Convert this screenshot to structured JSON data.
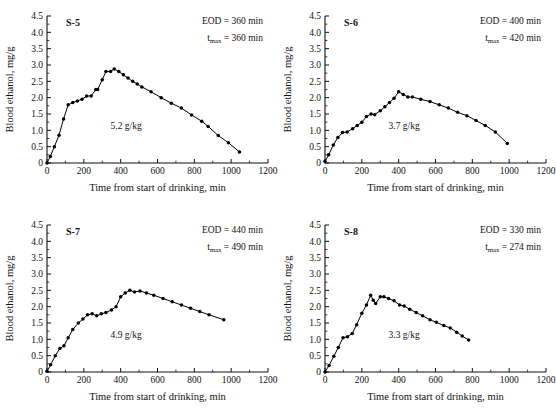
{
  "figure": {
    "panel_count": 4,
    "axis": {
      "xlabel": "Time from start of drinking, min",
      "ylabel": "Blood ethanol, mg/g",
      "xlim": [
        0,
        1200
      ],
      "ylim": [
        0,
        4.5
      ],
      "xticks": [
        0,
        200,
        400,
        600,
        800,
        1000,
        1200
      ],
      "xticklabels": [
        "0",
        "200",
        "400",
        "600",
        "800",
        "1000",
        "1200"
      ],
      "yticks": [
        0,
        0.5,
        1.0,
        1.5,
        2.0,
        2.5,
        3.0,
        3.5,
        4.0,
        4.5
      ],
      "yticklabels": [
        "0",
        "0.5",
        "1.0",
        "1.5",
        "2.0",
        "2.5",
        "3.0",
        "3.5",
        "4.0",
        "4.5"
      ],
      "grid": false,
      "legend": "none"
    }
  },
  "chart_data": [
    {
      "type": "line",
      "id": "S-5",
      "title": "S-5",
      "xlabel": "Time from start of drinking, min",
      "ylabel": "Blood ethanol, mg/g",
      "xlim": [
        0,
        1200
      ],
      "ylim": [
        0,
        4.5
      ],
      "annotations": {
        "eod_label": "EOD = 360 min",
        "tmax_prefix": "t",
        "tmax_sub": "max",
        "tmax_label": " = 360 min",
        "dose": "5.2 g/kg"
      },
      "eod_min": 360,
      "tmax_min": 360,
      "dose_g_per_kg": 5.2,
      "x": [
        0,
        18,
        40,
        65,
        90,
        115,
        140,
        165,
        190,
        215,
        240,
        265,
        275,
        300,
        320,
        345,
        365,
        390,
        415,
        440,
        465,
        490,
        515,
        565,
        620,
        675,
        730,
        785,
        840,
        875,
        930,
        985,
        1045
      ],
      "y": [
        0.0,
        0.2,
        0.5,
        0.85,
        1.35,
        1.78,
        1.85,
        1.9,
        1.95,
        2.05,
        2.05,
        2.25,
        2.25,
        2.55,
        2.8,
        2.8,
        2.88,
        2.8,
        2.7,
        2.6,
        2.5,
        2.42,
        2.33,
        2.18,
        2.0,
        1.83,
        1.68,
        1.47,
        1.28,
        1.12,
        0.84,
        0.62,
        0.34
      ]
    },
    {
      "type": "line",
      "id": "S-6",
      "title": "S-6",
      "xlabel": "Time from start of drinking, min",
      "ylabel": "Blood ethanol, mg/g",
      "xlim": [
        0,
        1200
      ],
      "ylim": [
        0,
        4.5
      ],
      "annotations": {
        "eod_label": "EOD = 400 min",
        "tmax_prefix": "t",
        "tmax_sub": "max",
        "tmax_label": " = 420 min",
        "dose": "3.7 g/kg"
      },
      "eod_min": 400,
      "tmax_min": 420,
      "dose_g_per_kg": 3.7,
      "x": [
        0,
        20,
        45,
        70,
        95,
        120,
        150,
        175,
        200,
        225,
        250,
        270,
        300,
        325,
        350,
        375,
        400,
        425,
        450,
        475,
        520,
        570,
        620,
        670,
        720,
        770,
        820,
        870,
        925,
        990
      ],
      "y": [
        0.05,
        0.25,
        0.55,
        0.78,
        0.93,
        0.95,
        1.05,
        1.15,
        1.25,
        1.42,
        1.5,
        1.48,
        1.6,
        1.72,
        1.85,
        1.98,
        2.18,
        2.1,
        2.02,
        2.02,
        1.95,
        1.88,
        1.78,
        1.68,
        1.55,
        1.45,
        1.3,
        1.15,
        0.95,
        0.6
      ]
    },
    {
      "type": "line",
      "id": "S-7",
      "title": "S-7",
      "xlabel": "Time from start of drinking, min",
      "ylabel": "Blood ethanol, mg/g",
      "xlim": [
        0,
        1200
      ],
      "ylim": [
        0,
        4.5
      ],
      "annotations": {
        "eod_label": "EOD = 440 min",
        "tmax_prefix": "t",
        "tmax_sub": "max",
        "tmax_label": " = 490 min",
        "dose": "4.9 g/kg"
      },
      "eod_min": 440,
      "tmax_min": 490,
      "dose_g_per_kg": 4.9,
      "x": [
        0,
        20,
        45,
        70,
        92,
        115,
        140,
        170,
        195,
        220,
        245,
        270,
        295,
        320,
        350,
        375,
        400,
        425,
        450,
        475,
        505,
        540,
        580,
        630,
        680,
        730,
        780,
        830,
        880,
        960
      ],
      "y": [
        0.02,
        0.22,
        0.5,
        0.72,
        0.8,
        1.05,
        1.3,
        1.5,
        1.62,
        1.75,
        1.78,
        1.72,
        1.78,
        1.82,
        1.9,
        2.0,
        2.3,
        2.42,
        2.5,
        2.45,
        2.48,
        2.42,
        2.35,
        2.25,
        2.15,
        2.05,
        1.95,
        1.85,
        1.75,
        1.6
      ]
    },
    {
      "type": "line",
      "id": "S-8",
      "title": "S-8",
      "xlabel": "Time from start of drinking, min",
      "ylabel": "Blood ethanol, mg/g",
      "xlim": [
        0,
        1200
      ],
      "ylim": [
        0,
        4.5
      ],
      "annotations": {
        "eod_label": "EOD = 330 min",
        "tmax_prefix": "t",
        "tmax_sub": "max",
        "tmax_label": " = 274 min",
        "dose": "3.3 g/kg"
      },
      "eod_min": 330,
      "tmax_min": 274,
      "dose_g_per_kg": 3.3,
      "x": [
        0,
        22,
        48,
        72,
        98,
        122,
        148,
        172,
        200,
        225,
        248,
        262,
        275,
        300,
        320,
        345,
        375,
        405,
        430,
        460,
        495,
        530,
        570,
        605,
        645,
        680,
        715,
        745,
        780
      ],
      "y": [
        0.0,
        0.2,
        0.48,
        0.75,
        1.05,
        1.08,
        1.18,
        1.45,
        1.8,
        2.05,
        2.35,
        2.2,
        2.1,
        2.3,
        2.3,
        2.25,
        2.18,
        2.05,
        2.02,
        1.92,
        1.82,
        1.72,
        1.6,
        1.52,
        1.42,
        1.35,
        1.22,
        1.1,
        0.98
      ]
    }
  ]
}
